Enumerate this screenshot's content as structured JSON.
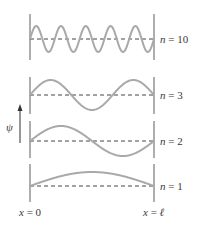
{
  "diagram": {
    "axis": {
      "symbol": "ψ"
    },
    "boundaries": {
      "left": "x = 0",
      "right": "x = ℓ"
    },
    "states": [
      {
        "n": 10,
        "label": "n = 10",
        "baseline_y": 39,
        "wall_top": 14,
        "wall_bottom": 60,
        "amplitude": 13
      },
      {
        "n": 3,
        "label": "n = 3",
        "baseline_y": 95,
        "wall_top": 77,
        "wall_bottom": 114,
        "amplitude": 15
      },
      {
        "n": 2,
        "label": "n = 2",
        "baseline_y": 141,
        "wall_top": 121,
        "wall_bottom": 158,
        "amplitude": 15
      },
      {
        "n": 1,
        "label": "n = 1",
        "baseline_y": 186,
        "wall_top": 164,
        "wall_bottom": 202,
        "amplitude": 14
      }
    ],
    "colors": {
      "wave": "#a9a9a9",
      "wall": "#777777",
      "dashed": "#444444",
      "text": "#3a3a3a"
    }
  }
}
